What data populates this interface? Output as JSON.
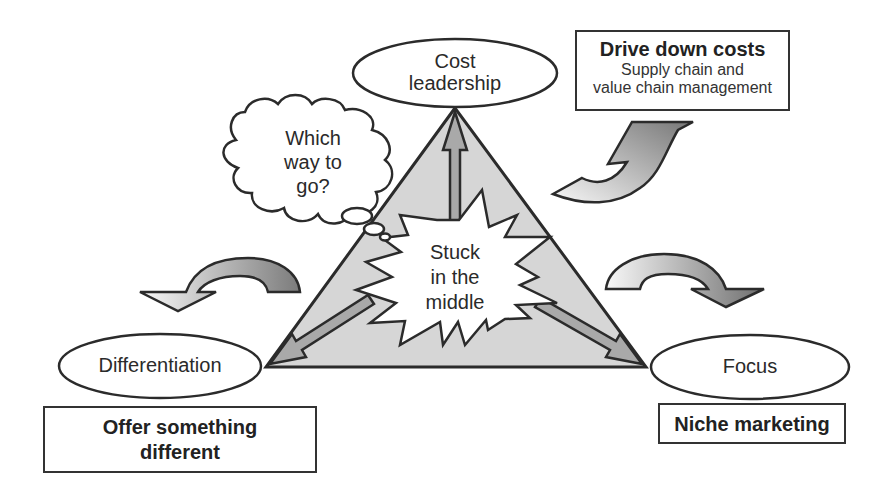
{
  "diagram": {
    "type": "strategy-triangle",
    "nodes": {
      "top": {
        "label_line1": "Cost",
        "label_line2": "leadership"
      },
      "left": {
        "label": "Differentiation"
      },
      "right": {
        "label": "Focus"
      }
    },
    "boxes": {
      "cost": {
        "title": "Drive down costs",
        "sub_line1": "Supply chain and",
        "sub_line2": "value chain management"
      },
      "differentiation": {
        "title_line1": "Offer something",
        "title_line2": "different"
      },
      "focus": {
        "title": "Niche marketing"
      }
    },
    "thought_bubble": {
      "line1": "Which",
      "line2": "way to",
      "line3": "go?"
    },
    "center_burst": {
      "line1": "Stuck",
      "line2": "in the",
      "line3": "middle"
    },
    "colors": {
      "outline": "#2b2b2b",
      "triangle_fill": "#d6d6d6",
      "arrow_fill_dark": "#7a7a7a",
      "arrow_fill_light": "#f4f4f4",
      "inner_arrow_fill": "#a9a9a9"
    },
    "icons": [
      "curved-arrow-up-right",
      "curved-arrow-down-left",
      "curved-arrow-down-right",
      "thought-cloud",
      "explosion-burst"
    ]
  }
}
